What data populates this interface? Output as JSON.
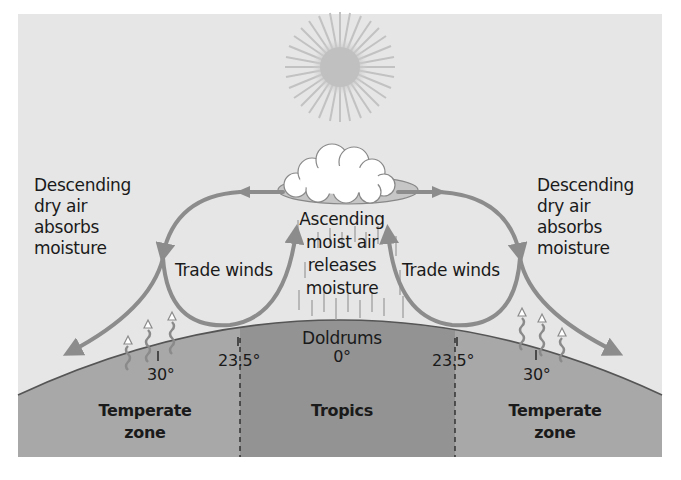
{
  "diagram": {
    "colors": {
      "panel_background": "#e6e6e6",
      "earth_temperate": "#a8a8a8",
      "earth_tropics": "#939393",
      "arrows": "#8c8c8c",
      "text": "#1a1a1a"
    },
    "elements": {
      "sun": "sun-icon",
      "cloud": "cloud-icon",
      "rain": "rain-streaks",
      "heat": "rising-heat-arrows"
    },
    "labels": {
      "left_descending": [
        "Descending",
        "dry air",
        "absorbs",
        "moisture"
      ],
      "right_descending": [
        "Descending",
        "dry air",
        "absorbs",
        "moisture"
      ],
      "left_trade_winds": "Trade winds",
      "right_trade_winds": "Trade winds",
      "ascending": [
        "Ascending",
        "moist air",
        "releases",
        "moisture"
      ],
      "doldrums": "Doldrums"
    },
    "latitudes": {
      "left_30": "30°",
      "left_23_5": "23.5°",
      "equator": "0°",
      "right_23_5": "23.5°",
      "right_30": "30°"
    },
    "zones": {
      "left": [
        "Temperate",
        "zone"
      ],
      "center": "Tropics",
      "right": [
        "Temperate",
        "zone"
      ]
    }
  }
}
